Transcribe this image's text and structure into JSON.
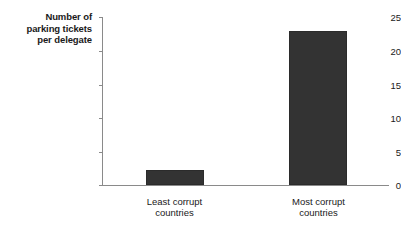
{
  "chart_data": {
    "type": "bar",
    "title": "",
    "subtitle": "",
    "xlabel": "",
    "ylabel": "Number of\nparking tickets\nper delegate",
    "categories": [
      "Least corrupt\ncountries",
      "Most corrupt\ncountries"
    ],
    "values": [
      2.3,
      23
    ],
    "ylim": [
      0,
      25
    ],
    "yticks": [
      0,
      5,
      10,
      15,
      20,
      25
    ],
    "ytick_labels": [
      "0",
      "5",
      "10",
      "15",
      "20",
      "25"
    ],
    "grid": false,
    "legend": false,
    "legend_position": "none",
    "bar_color": "#333333",
    "axis_color": "#8a8a8a",
    "background": "#ffffff"
  },
  "axis": {
    "y_title": "Number of\nparking tickets\nper delegate"
  },
  "categories": {
    "left": "Least corrupt\ncountries",
    "right": "Most corrupt\ncountries"
  },
  "ticks": {
    "t0": "0",
    "t5": "5",
    "t10": "10",
    "t15": "15",
    "t20": "20",
    "t25": "25"
  }
}
